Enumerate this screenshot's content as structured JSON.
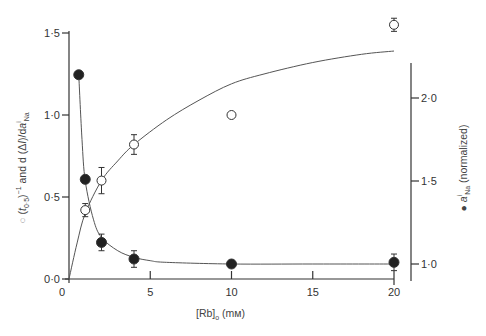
{
  "chart_data": {
    "type": "scatter",
    "title": "",
    "xlabel": "[Rb]o (mM)",
    "ylabel_left": "(t0·5)^-1 and d(ΔI)/da^i_Na",
    "ylabel_right": "a^i_Na (normalized)",
    "xlim": [
      0,
      20
    ],
    "ylim_left": [
      0,
      1.5
    ],
    "ylim_right": [
      0.9,
      2.2
    ],
    "x_ticks": [
      0,
      5,
      10,
      15,
      20
    ],
    "x_tick_labels": [
      "0",
      "5",
      "10",
      "15",
      "20"
    ],
    "y_left_ticks": [
      0,
      0.5,
      1.0,
      1.5
    ],
    "y_left_tick_labels": [
      "0·0",
      "0·5",
      "1·0",
      "1·5"
    ],
    "y_right_ticks": [
      1.0,
      1.5,
      2.0
    ],
    "y_right_tick_labels": [
      "1·0",
      "1·5",
      "2·0"
    ],
    "grid": false,
    "legend": "inline in axis labels (○ left axis, ● right axis)",
    "series": [
      {
        "name": "(t0·5)^-1 and d(ΔI)/da^i_Na",
        "marker": "open-circle",
        "axis": "left",
        "x": [
          1,
          2,
          4,
          10,
          20
        ],
        "values": [
          0.42,
          0.6,
          0.82,
          1.0,
          1.55
        ],
        "errors": [
          0.04,
          0.08,
          0.06,
          0,
          0.04
        ]
      },
      {
        "name": "a^i_Na (normalized)",
        "marker": "filled-circle",
        "axis": "right",
        "x": [
          0.6,
          1,
          2,
          4,
          10,
          20
        ],
        "values": [
          2.14,
          1.51,
          1.13,
          1.03,
          1.0,
          1.01
        ],
        "errors": [
          0,
          0,
          0.05,
          0.05,
          0,
          0.05
        ]
      }
    ],
    "fit_curves": [
      {
        "name": "rising fit (left axis)",
        "x": [
          0,
          0.5,
          1,
          2,
          3,
          4,
          6,
          8,
          10,
          12,
          15,
          18,
          20
        ],
        "values": [
          0,
          0.22,
          0.4,
          0.6,
          0.72,
          0.82,
          0.97,
          1.09,
          1.19,
          1.25,
          1.32,
          1.37,
          1.39
        ]
      },
      {
        "name": "falling fit (right axis)",
        "x": [
          0.6,
          0.8,
          1,
          1.5,
          2,
          3,
          4,
          5,
          6,
          10,
          15,
          20
        ],
        "values": [
          2.14,
          1.75,
          1.5,
          1.27,
          1.16,
          1.08,
          1.04,
          1.02,
          1.01,
          1.0,
          1.0,
          1.0
        ]
      }
    ]
  },
  "labels": {
    "x_axis_title": "[Rb]",
    "x_axis_sub": "o",
    "x_axis_unit": " (mм)",
    "left_axis_title": "○ (t",
    "right_axis_title": "(normalized)"
  }
}
